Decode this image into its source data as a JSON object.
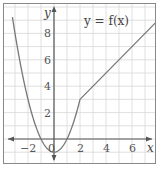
{
  "chart_data": {
    "type": "line",
    "title": "",
    "xlabel": "x",
    "ylabel": "y",
    "function_label": "y = f(x)",
    "xlim": [
      -4,
      8
    ],
    "ylim": [
      -2,
      10
    ],
    "grid": true,
    "x_ticks": [
      -2,
      0,
      2,
      4,
      6
    ],
    "y_ticks": [
      2,
      4,
      6,
      8
    ],
    "x_tick_labels": [
      "−2",
      "0",
      "2",
      "4",
      "6"
    ],
    "y_tick_labels": [
      "2",
      "4",
      "6",
      "8"
    ],
    "series": [
      {
        "name": "f(x) = x^2 - 1 for x <= 2",
        "x": [
          -3.2,
          -3,
          -2,
          -1,
          0,
          1,
          2
        ],
        "y": [
          9.24,
          8,
          3,
          0,
          -1,
          0,
          3
        ]
      },
      {
        "name": "f(x) = x + 1 for x >= 2",
        "x": [
          2,
          4,
          6,
          7.8
        ],
        "y": [
          3,
          5,
          7,
          8.8
        ]
      }
    ],
    "colors": {
      "curve": "#777777",
      "axis": "#555555",
      "grid": "#d8d8d8",
      "frame": "#888888"
    }
  }
}
